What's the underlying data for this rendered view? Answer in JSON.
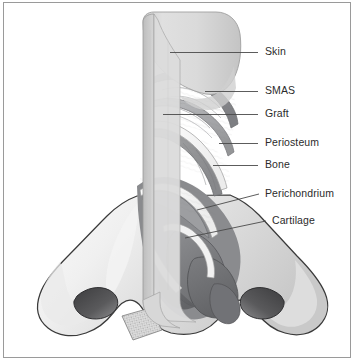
{
  "figure": {
    "border_color": "#9a9a9a",
    "background_color": "#ffffff"
  },
  "palette": {
    "skin_light": "#e4e4e4",
    "skin_mid": "#d2d2d2",
    "skin_shadow": "#bdbdbd",
    "smas": "#8f9093",
    "graft": "#a9aaac",
    "periosteum": "#f4f4f4",
    "bone": "#9b9c9e",
    "perichondrium": "#efefef",
    "cartilage": "#7e7f82",
    "cartilage_dark": "#6c6d70",
    "nostril_dark": "#4a4a4c",
    "outline": "#3a3a3a",
    "leader_line": "#4a4a4a",
    "label_text": "#2b2b2b"
  },
  "labels": [
    {
      "id": "skin",
      "text": "Skin",
      "text_x": 265,
      "text_y": 46,
      "leader": {
        "x1": 170,
        "y1": 52.5,
        "x2": 258,
        "y2": 52.5
      }
    },
    {
      "id": "smas",
      "text": "SMAS",
      "text_x": 265,
      "text_y": 85,
      "leader": {
        "x1": 205,
        "y1": 91.5,
        "x2": 258,
        "y2": 91.5
      }
    },
    {
      "id": "graft",
      "text": "Graft",
      "text_x": 265,
      "text_y": 108,
      "leader": {
        "x1": 163,
        "y1": 114.5,
        "x2": 258,
        "y2": 114.5
      }
    },
    {
      "id": "periosteum",
      "text": "Periosteum",
      "text_x": 265,
      "text_y": 137,
      "leader": {
        "x1": 219,
        "y1": 143.5,
        "x2": 258,
        "y2": 143.5
      }
    },
    {
      "id": "bone",
      "text": "Bone",
      "text_x": 265,
      "text_y": 159,
      "leader": {
        "x1": 213,
        "y1": 165.5,
        "x2": 258,
        "y2": 165.5
      }
    },
    {
      "id": "perichondrium",
      "text": "Perichondrium",
      "text_x": 265,
      "text_y": 188,
      "leader": {
        "x1": 197,
        "y1": 210,
        "x2": 259,
        "y2": 194
      }
    },
    {
      "id": "cartilage",
      "text": "Cartilage",
      "text_x": 272,
      "text_y": 215,
      "leader": {
        "x1": 185,
        "y1": 238,
        "x2": 266,
        "y2": 221
      }
    }
  ],
  "anatomy_regions": [
    {
      "id": "nose-external",
      "name": "external nasal skin envelope"
    },
    {
      "id": "dorsum-skin-block",
      "name": "skin flap over dorsum"
    },
    {
      "id": "smas-layer",
      "name": "SMAS layer"
    },
    {
      "id": "graft-layer",
      "name": "onlay graft"
    },
    {
      "id": "periosteum-layer",
      "name": "periosteum"
    },
    {
      "id": "bone-layer",
      "name": "nasal bone"
    },
    {
      "id": "perichondrium-layer",
      "name": "perichondrium"
    },
    {
      "id": "cartilage-upper-lateral",
      "name": "upper lateral cartilage"
    },
    {
      "id": "cartilage-lower-lateral",
      "name": "lower lateral cartilage"
    },
    {
      "id": "left-nostril",
      "name": "left nostril"
    },
    {
      "id": "right-nostril",
      "name": "right nostril"
    },
    {
      "id": "cut-edge-hatch",
      "name": "hatched cut edge of columella"
    }
  ]
}
